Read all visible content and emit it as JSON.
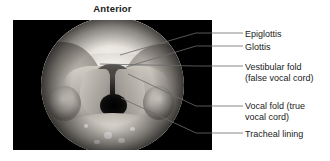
{
  "figure": {
    "orientation_label": "Anterior",
    "photo_caption_region": "endoscopic-view-of-larynx"
  },
  "callouts": [
    {
      "id": "epiglottis",
      "text": "Epiglottis"
    },
    {
      "id": "glottis",
      "text": "Glottis"
    },
    {
      "id": "vestibular-fold",
      "text": "Vestibular fold\n(false vocal cord)"
    },
    {
      "id": "vocal-fold",
      "text": "Vocal fold (true\nvocal cord)"
    },
    {
      "id": "tracheal-lining",
      "text": "Tracheal lining"
    }
  ],
  "colors": {
    "background": "#ffffff",
    "photo_background": "#000000",
    "text": "#1a1a1a",
    "leader_line": "#6b6b6b"
  }
}
